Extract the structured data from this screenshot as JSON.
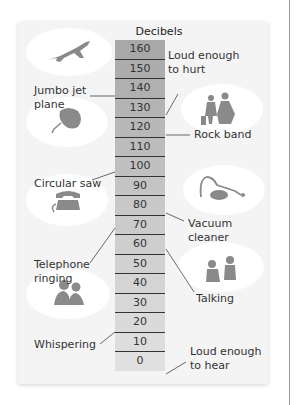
{
  "chart_data": {
    "type": "table",
    "title": "Decibels",
    "scale": [
      160,
      150,
      140,
      130,
      120,
      110,
      100,
      90,
      80,
      70,
      60,
      50,
      40,
      30,
      20,
      10,
      0
    ],
    "annotations": [
      {
        "label": "Loud enough to hurt",
        "value": 140,
        "side": "right"
      },
      {
        "label": "Jumbo jet plane",
        "value": 140,
        "side": "left"
      },
      {
        "label": "Rock band",
        "value": 120,
        "side": "right"
      },
      {
        "label": "Circular saw",
        "value": 100,
        "side": "left"
      },
      {
        "label": "Vacuum cleaner",
        "value": 80,
        "side": "right"
      },
      {
        "label": "Telephone ringing",
        "value": 70,
        "side": "left"
      },
      {
        "label": "Talking",
        "value": 60,
        "side": "right"
      },
      {
        "label": "Whispering",
        "value": 20,
        "side": "left"
      },
      {
        "label": "Loud enough to hear",
        "value": 0,
        "side": "right"
      }
    ]
  },
  "scale": {
    "title": "Decibels",
    "rows": [
      "160",
      "150",
      "140",
      "130",
      "120",
      "110",
      "100",
      "90",
      "80",
      "70",
      "60",
      "50",
      "40",
      "30",
      "20",
      "10",
      "0"
    ],
    "colors": [
      "#a8a8a8",
      "#acacac",
      "#b0b0b0",
      "#b4b4b4",
      "#b8b8b8",
      "#bcbcbc",
      "#c0c0c0",
      "#c4c4c4",
      "#c8c8c8",
      "#cbcbcb",
      "#cecece",
      "#d1d1d1",
      "#d4d4d4",
      "#d7d7d7",
      "#dadada",
      "#dddddd",
      "#e0e0e0"
    ]
  },
  "labels": {
    "hurt": "Loud enough\nto hurt",
    "jet": "Jumbo jet\nplane",
    "rock": "Rock band",
    "saw": "Circular saw",
    "vacuum": "Vacuum\ncleaner",
    "phone": "Telephone\nringing",
    "talking": "Talking",
    "whisper": "Whispering",
    "hear": "Loud enough\nto hear"
  },
  "icons": {
    "jet": "airplane-icon",
    "rock": "rock-band-icon",
    "saw": "circular-saw-icon",
    "vacuum": "vacuum-cleaner-icon",
    "phone": "telephone-icon",
    "talking": "talking-people-icon",
    "whisper": "whispering-people-icon"
  }
}
